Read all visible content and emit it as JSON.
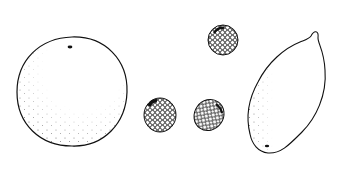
{
  "scene": {
    "description": "Black and white line drawing of fruits",
    "background": "#ffffff",
    "ink": "#111111",
    "items": [
      {
        "name": "orange",
        "cx": 72,
        "cy": 92,
        "r": 55
      },
      {
        "name": "berry-top",
        "cx": 223,
        "cy": 40,
        "rx": 15,
        "ry": 15
      },
      {
        "name": "berry-left",
        "cx": 160,
        "cy": 115,
        "rx": 16,
        "ry": 17
      },
      {
        "name": "berry-middle",
        "cx": 209,
        "cy": 115,
        "rx": 15,
        "ry": 16
      },
      {
        "name": "lemon"
      }
    ]
  }
}
